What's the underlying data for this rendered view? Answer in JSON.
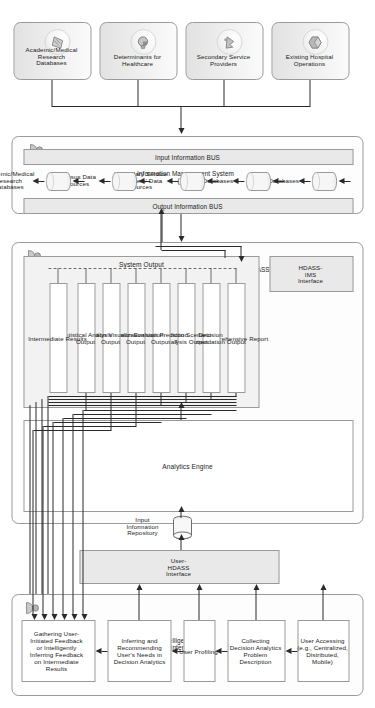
{
  "diagram": {
    "orientation": "rotated-90",
    "colors": {
      "line": "#2a2a2a",
      "border": "#9a9a9a",
      "fill_grey": "#e9e9e9",
      "fill_light": "#f2f2f2",
      "text": "#222222"
    }
  },
  "sources": {
    "items": [
      {
        "label": "Existing Hospital\nOperations",
        "icon": "hospital-icon"
      },
      {
        "label": "Secondary Service\nProviders",
        "icon": "providers-icon"
      },
      {
        "label": "Determinants for\nHealthcare",
        "icon": "determinants-icon"
      },
      {
        "label": "Academic/Medical\nResearch\nDatabases",
        "icon": "research-icon"
      }
    ]
  },
  "ims": {
    "title": "Information Management System\n(IMS)",
    "input_bus": "Input Information BUS",
    "output_bus": "Output Information BUS",
    "icon": "ims-actor-icon",
    "databases": [
      {
        "label": "HIS Databases",
        "icon": "database-cylinder-icon"
      },
      {
        "label": "MIS Databases",
        "icon": "database-cylinder-icon"
      },
      {
        "label": "Secondary Service\nProviders' Data\nSources",
        "icon": "database-cylinder-icon"
      },
      {
        "label": "Census Data\nSources",
        "icon": "database-cylinder-icon"
      },
      {
        "label": "Academic/Medical\nResearch\nDatabases",
        "icon": "database-cylinder-icon"
      }
    ]
  },
  "hdass": {
    "title": "Healthcare Decision Analytics & Support System (HDASS)",
    "icon": "hdass-actor-icon",
    "ims_interface": "HDASS-\nIMS\nInterface",
    "system_output_title": "System Output",
    "outputs": [
      "Comprehensive Report",
      "Decision\nRecommendation Output",
      "Decision Scenario\nAnalysis Output",
      "Decision Prediction\nOutput",
      "Decision Evaluation\nOutput",
      "Simulation Visualization\nOutput",
      "Statistical Analysis\nOutput",
      "Intermediate Results"
    ],
    "analytics_engine": "Analytics Engine",
    "input_repository": "Input\nInformation\nRepository",
    "input_repository_icon": "repository-cylinder-icon",
    "user_interface": "User-\nHDASS\nInterface"
  },
  "iui": {
    "title": "Intelligent User\nInterface",
    "icon": "user-actor-icon",
    "steps": [
      "User Accessing\n(e.g., Centralized,\nDistributed,\nMobile)",
      "Collecting\nDecision Analytics\nProblem\nDescription",
      "User Profiling",
      "Inferring and\nRecommending\nUser's Needs in\nDecision Analytics",
      "Gathering User-\nInitiated Feedback\nor Intelligently\nInferring Feedback\non Intermediate\nResults"
    ]
  }
}
